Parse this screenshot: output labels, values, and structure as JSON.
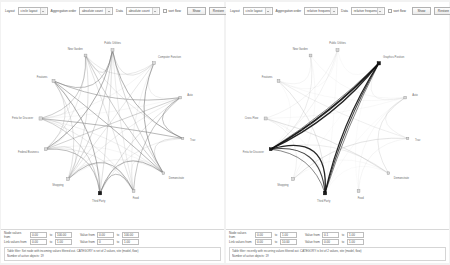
{
  "panels": [
    {
      "id": "left",
      "toolbar": {
        "layout_label": "Layout",
        "layout_value": "circle layout",
        "aggregation_label": "Aggregation order",
        "aggregation_value": "absolute count",
        "data_label": "Data",
        "data_value": "absolute count",
        "sort_checkbox_label": "sort flow",
        "show_button": "Show",
        "restore_button": "Restore"
      },
      "graph": {
        "nodes": [
          {
            "label": "Public Utilities",
            "angle": -90,
            "dark": false,
            "size": 3.0
          },
          {
            "label": "Computer Function",
            "angle": -55,
            "dark": false,
            "size": 3.0
          },
          {
            "label": "Auto",
            "angle": -20,
            "dark": false,
            "size": 2.6
          },
          {
            "label": "Trav",
            "angle": 13,
            "dark": false,
            "size": 2.4
          },
          {
            "label": "Demonstrate",
            "angle": 45,
            "dark": false,
            "size": 2.6
          },
          {
            "label": "Food",
            "angle": 73,
            "dark": false,
            "size": 2.8
          },
          {
            "label": "Third Party",
            "angle": 100,
            "dark": true,
            "size": 3.4
          },
          {
            "label": "Shopping",
            "angle": 128,
            "dark": false,
            "size": 3.0
          },
          {
            "label": "Federal Business",
            "angle": 158,
            "dark": false,
            "size": 2.8
          },
          {
            "label": "Finta for Discover",
            "angle": 183,
            "dark": false,
            "size": 3.2
          },
          {
            "label": "Features",
            "angle": 215,
            "dark": false,
            "size": 3.0
          },
          {
            "label": "New Garden",
            "angle": 248,
            "dark": false,
            "size": 2.8
          }
        ],
        "density": "high",
        "edge_color": "#7a7a7a",
        "highlight_color": "#1a1a1a"
      },
      "filters": {
        "node_values_label": "Node values from",
        "node_from": "0.00",
        "node_to": "100.00",
        "link_values_label": "Link values from",
        "link_from": "0.00",
        "link_to": "1.00",
        "value_from_label": "Value from",
        "value_from": "0.00",
        "value_to": "100.00",
        "value2_from_label": "Value from",
        "value2_from": "0",
        "value2_to": "1.00",
        "to_label": "to",
        "note_line1": "Table filter: Set node with incoming values filtered out. CATEGORY is set of 2 values, site (model, flow)",
        "note_line2": "Number of active objects: 19"
      }
    },
    {
      "id": "right",
      "toolbar": {
        "layout_label": "Layout",
        "layout_value": "circle layout",
        "aggregation_label": "Aggregation order",
        "aggregation_value": "relative frequency",
        "data_label": "Data",
        "data_value": "relative frequency",
        "sort_checkbox_label": "sort flow",
        "show_button": "Show",
        "restore_button": "Restore"
      },
      "graph": {
        "nodes": [
          {
            "label": "Public Utilities",
            "angle": -90,
            "dark": false,
            "size": 3.0
          },
          {
            "label": "Graphics Position",
            "angle": -55,
            "dark": true,
            "size": 3.4
          },
          {
            "label": "Auto",
            "angle": -20,
            "dark": false,
            "size": 2.6
          },
          {
            "label": "Trav",
            "angle": 13,
            "dark": false,
            "size": 2.4
          },
          {
            "label": "Demonstrate",
            "angle": 45,
            "dark": false,
            "size": 2.6
          },
          {
            "label": "Food",
            "angle": 73,
            "dark": false,
            "size": 2.8
          },
          {
            "label": "Third Party",
            "angle": 100,
            "dark": true,
            "size": 3.4
          },
          {
            "label": "Shopping",
            "angle": 128,
            "dark": false,
            "size": 3.0
          },
          {
            "label": "Finta for Discover",
            "angle": 158,
            "dark": true,
            "size": 3.0
          },
          {
            "label": "Cross Flow",
            "angle": 183,
            "dark": false,
            "size": 3.0
          },
          {
            "label": "Features",
            "angle": 215,
            "dark": false,
            "size": 2.8
          },
          {
            "label": "New Garden",
            "angle": 248,
            "dark": false,
            "size": 2.8
          }
        ],
        "density": "low",
        "edge_color": "#b5b5b5",
        "highlight_color": "#111111"
      },
      "filters": {
        "node_values_label": "Node values from",
        "node_from": "0.00",
        "node_to": "1.00",
        "link_values_label": "Link values from",
        "link_from": "0.00",
        "link_to": "10.00",
        "value_from_label": "Value from",
        "value_from": "0.1",
        "value_to": "1.00",
        "value2_from_label": "Value from",
        "value2_from": "0.00",
        "value2_to": "1.00",
        "to_label": "to",
        "note_line1": "Table filter: recently with recurring values filtered out. CATEGORY is list of 2 values, site (model, flow)",
        "note_line2": "Number of active objects: 19"
      }
    }
  ]
}
